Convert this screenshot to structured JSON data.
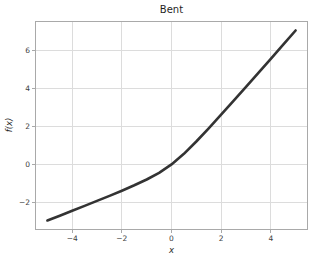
{
  "chart_data": {
    "type": "line",
    "title": "Bent",
    "xlabel": "x",
    "ylabel": "f(x)",
    "xlim": [
      -5.5,
      5.5
    ],
    "ylim": [
      -3.45,
      7.55
    ],
    "xticks": [
      -4,
      -2,
      0,
      2,
      4
    ],
    "yticks": [
      -2,
      0,
      2,
      4,
      6
    ],
    "grid": true,
    "legend": false,
    "series": [
      {
        "name": "bent-identity",
        "x": [
          -5,
          -4.5,
          -4,
          -3.5,
          -3,
          -2.5,
          -2,
          -1.5,
          -1,
          -0.5,
          0,
          0.5,
          1,
          1.5,
          2,
          2.5,
          3,
          3.5,
          4,
          4.5,
          5
        ],
        "y": [
          -2.95,
          -2.695,
          -2.438,
          -2.18,
          -1.919,
          -1.654,
          -1.382,
          -1.099,
          -0.793,
          -0.441,
          0.0,
          0.559,
          1.207,
          1.901,
          2.618,
          3.346,
          4.081,
          4.82,
          5.562,
          6.305,
          7.05
        ]
      }
    ]
  },
  "colors": {
    "background": "#ffffff",
    "line": "#333333",
    "grid": "#dcdcdc",
    "spine": "#a9a9a9",
    "tick_text": "#404040",
    "title_text": "#1f1f1f"
  },
  "geometry": {
    "plot_left": 35,
    "plot_top": 21,
    "plot_width": 273,
    "plot_height": 209,
    "tick_length": 3
  }
}
